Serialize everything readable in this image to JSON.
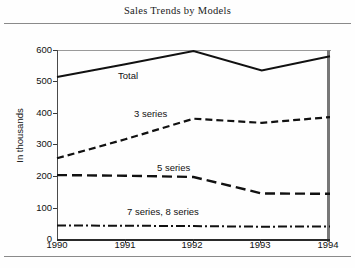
{
  "title": "Sales Trends by Models",
  "chart_data": {
    "type": "line",
    "title": "Sales Trends by Models",
    "xlabel": "",
    "ylabel": "In thousands",
    "categories": [
      "1990",
      "1991",
      "1992",
      "1993",
      "1994"
    ],
    "x": [
      1990,
      1991,
      1992,
      1993,
      1994
    ],
    "ylim": [
      0,
      600
    ],
    "yticks": [
      0,
      100,
      200,
      300,
      400,
      500,
      600
    ],
    "grid": false,
    "legend": "inline-labels",
    "series": [
      {
        "name": "Total",
        "label": "Total",
        "style": "solid",
        "values": [
          515,
          555,
          597,
          535,
          580
        ]
      },
      {
        "name": "3 series",
        "label": "3 series",
        "style": "dashed",
        "values": [
          258,
          318,
          383,
          370,
          388
        ]
      },
      {
        "name": "5 series",
        "label": "5 series",
        "style": "long-dashed",
        "values": [
          205,
          203,
          199,
          147,
          146
        ]
      },
      {
        "name": "7 series, 8 series",
        "label": "7 series, 8 series",
        "style": "dash-dot",
        "values": [
          46,
          45,
          44,
          42,
          43
        ]
      }
    ],
    "colors": {
      "line": "#111111",
      "axis": "#333333",
      "background": "#ffffff"
    }
  }
}
